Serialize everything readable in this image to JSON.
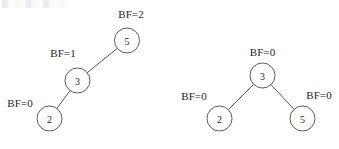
{
  "figure": {
    "background_color": "#ffffff",
    "stroke_color": "#5a5a5a",
    "text_color": "#232323",
    "faint_header_text": "█░▒░█▒░█▒░▒",
    "width": 339,
    "height": 149
  },
  "trees": [
    {
      "id": "left-tree",
      "name": "unbalanced-avl-tree",
      "nodes": [
        {
          "key": "2",
          "bf": "BF=0",
          "cx": 49.5,
          "cy": 118.5,
          "r": 12.5,
          "bf_x": 20,
          "bf_y": 103
        },
        {
          "key": "3",
          "bf": "BF=1",
          "cx": 77.5,
          "cy": 80.5,
          "r": 12.5,
          "bf_x": 63,
          "bf_y": 53
        },
        {
          "key": "5",
          "bf": "BF=2",
          "cx": 127.0,
          "cy": 40.5,
          "r": 12.5,
          "bf_x": 131,
          "bf_y": 14
        }
      ],
      "edges": [
        {
          "from": "3",
          "to": "2"
        },
        {
          "from": "5",
          "to": "3"
        }
      ]
    },
    {
      "id": "right-tree",
      "name": "balanced-avl-tree",
      "nodes": [
        {
          "key": "3",
          "bf": "BF=0",
          "cx": 262.5,
          "cy": 75.5,
          "r": 12.5,
          "bf_x": 262.5,
          "bf_y": 52
        },
        {
          "key": "2",
          "bf": "BF=0",
          "cx": 219.5,
          "cy": 118.5,
          "r": 12.5,
          "bf_x": 194,
          "bf_y": 96
        },
        {
          "key": "5",
          "bf": "BF=0",
          "cx": 302.5,
          "cy": 118.5,
          "r": 12.5,
          "bf_x": 319,
          "bf_y": 95
        }
      ],
      "edges": [
        {
          "from": "3",
          "to": "2"
        },
        {
          "from": "3",
          "to": "5"
        }
      ]
    }
  ]
}
